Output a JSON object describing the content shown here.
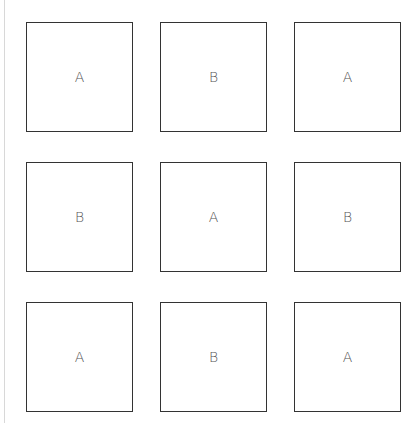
{
  "grid": {
    "rows": 3,
    "cols": 3,
    "cells": [
      {
        "label": "A"
      },
      {
        "label": "B"
      },
      {
        "label": "A"
      },
      {
        "label": "B"
      },
      {
        "label": "A"
      },
      {
        "label": "B"
      },
      {
        "label": "A"
      },
      {
        "label": "B"
      },
      {
        "label": "A"
      }
    ]
  },
  "colors": {
    "border": "#333333",
    "text": "#555555",
    "rule": "#d8d8d8"
  }
}
